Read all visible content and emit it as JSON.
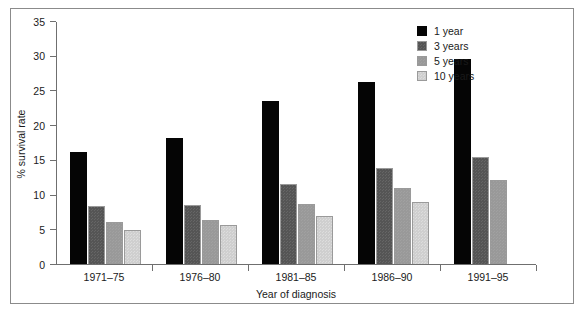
{
  "chart_data": {
    "type": "bar",
    "title": "",
    "xlabel": "Year of diagnosis",
    "ylabel": "% survival rate",
    "ylim": [
      0,
      35
    ],
    "yticks": [
      0,
      5,
      10,
      15,
      20,
      25,
      30,
      35
    ],
    "grid": false,
    "legend_position": "top-right",
    "categories": [
      "1971–75",
      "1976–80",
      "1981–85",
      "1986–90",
      "1991–95"
    ],
    "series": [
      {
        "name": "1 year",
        "color": "#050505",
        "values": [
          16.1,
          18.2,
          23.5,
          26.2,
          29.6
        ]
      },
      {
        "name": "3 years",
        "color": "#555555",
        "values": [
          8.3,
          8.5,
          11.5,
          13.9,
          15.4
        ]
      },
      {
        "name": "5 years",
        "color": "#999999",
        "values": [
          6.1,
          6.4,
          8.7,
          11.0,
          12.1
        ]
      },
      {
        "name": "10 years",
        "color": "#cfcfcf",
        "values": [
          4.9,
          5.6,
          6.9,
          8.9,
          null
        ]
      }
    ]
  }
}
